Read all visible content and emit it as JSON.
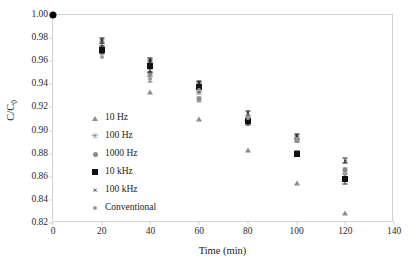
{
  "chart_data": {
    "type": "scatter",
    "title": "",
    "xlabel": "Time (min)",
    "ylabel": "C/C0",
    "ylabel_main": "C/C",
    "ylabel_sub": "0",
    "xlim": [
      0,
      140
    ],
    "ylim": [
      0.82,
      1.0
    ],
    "xticks": [
      0,
      20,
      40,
      60,
      80,
      100,
      120,
      140
    ],
    "yticks": [
      0.82,
      0.84,
      0.86,
      0.88,
      0.9,
      0.92,
      0.94,
      0.96,
      0.98,
      1.0
    ],
    "xtick_labels": [
      "0",
      "20",
      "40",
      "60",
      "80",
      "100",
      "120",
      "140"
    ],
    "ytick_labels": [
      "0.82",
      "0.84",
      "0.86",
      "0.88",
      "0.90",
      "0.92",
      "0.94",
      "0.96",
      "0.98",
      "1.00"
    ],
    "grid": false,
    "legend_position": "inside-left",
    "x": [
      0,
      20,
      40,
      60,
      80,
      100,
      120
    ],
    "series": [
      {
        "name": "10 Hz",
        "marker": "triangle",
        "color": "#8d8d8d",
        "values": [
          1.0,
          0.97,
          0.933,
          0.91,
          0.883,
          0.855,
          0.829
        ],
        "errors": [
          0,
          0,
          0,
          0,
          0,
          0,
          0
        ]
      },
      {
        "name": "100 Hz",
        "marker": "star",
        "color": "#7d7d7d",
        "values": [
          1.0,
          0.975,
          0.946,
          0.936,
          0.908,
          0.893,
          0.858
        ],
        "errors": [
          0,
          0.003,
          0.004,
          0.004,
          0.002,
          0.003,
          0.002
        ]
      },
      {
        "name": "1000 Hz",
        "marker": "circle",
        "color": "#8a8a8a",
        "values": [
          1.0,
          0.968,
          0.95,
          0.927,
          0.909,
          0.892,
          0.866
        ],
        "errors": [
          0,
          0.002,
          0.003,
          0.002,
          0.002,
          0.002,
          0.002
        ]
      },
      {
        "name": "10 kHz",
        "marker": "square",
        "color": "#111111",
        "values": [
          1.0,
          0.97,
          0.956,
          0.938,
          0.908,
          0.88,
          0.858
        ],
        "errors": [
          0,
          0.003,
          0.005,
          0.005,
          0.003,
          0.002,
          0.004
        ]
      },
      {
        "name": "100 kHz",
        "marker": "cross",
        "color": "#1a1a1a",
        "values": [
          1.0,
          0.978,
          0.961,
          0.94,
          0.915,
          0.895,
          0.874
        ],
        "errors": [
          0,
          0.002,
          0.002,
          0.002,
          0.002,
          0.002,
          0.002
        ]
      },
      {
        "name": "Conventional",
        "marker": "dot",
        "color": "#9a9a9a",
        "values": [
          1.0,
          0.964,
          0.945,
          0.935,
          0.911,
          0.893,
          0.862
        ],
        "errors": [
          0,
          0,
          0,
          0,
          0,
          0,
          0
        ]
      }
    ],
    "origin_point": {
      "x": 0,
      "y": 1.0,
      "marker": "filled-circle",
      "color": "#000000"
    }
  },
  "legend": {
    "items": [
      {
        "label": "10 Hz",
        "marker": "triangle"
      },
      {
        "label": "100 Hz",
        "marker": "star"
      },
      {
        "label": "1000 Hz",
        "marker": "circle"
      },
      {
        "label": "10 kHz",
        "marker": "square"
      },
      {
        "label": "100 kHz",
        "marker": "cross"
      },
      {
        "label": "Conventional",
        "marker": "dot"
      }
    ]
  },
  "colors": {
    "frame": "#d2d2d2",
    "text": "#1a1a1a",
    "background": "#ffffff"
  }
}
